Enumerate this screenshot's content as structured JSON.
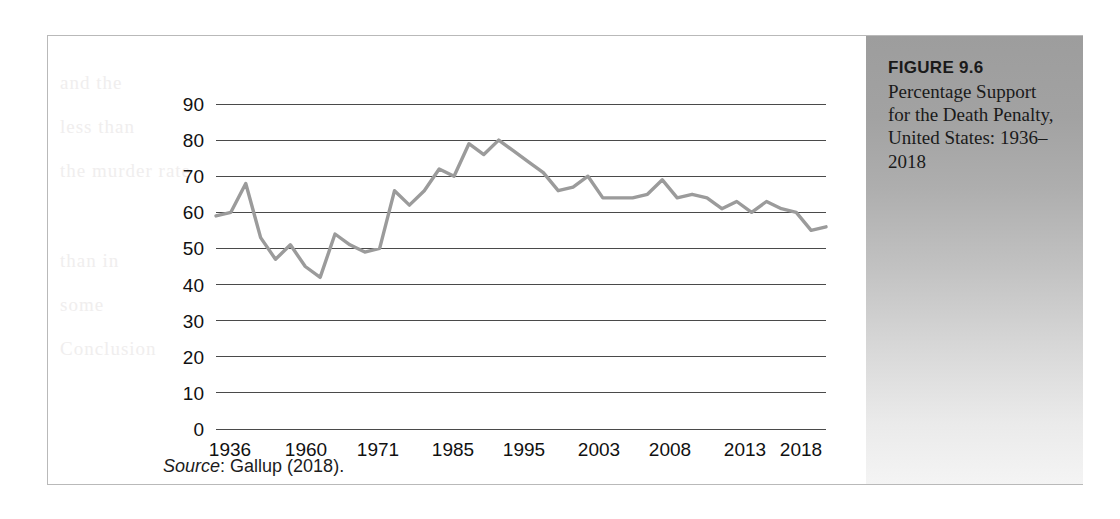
{
  "figure": {
    "title": "FIGURE 9.6",
    "caption": "Percentage Support for the Death Penalty, United States: 1936–2018"
  },
  "source": {
    "label": "Source",
    "separator": ": ",
    "text": "Gallup (2018)."
  },
  "bleed_text": [
    "and the",
    "less than",
    "the murder rate",
    "than in",
    "some",
    "Conclusion"
  ],
  "chart_data": {
    "type": "line",
    "title": "Percentage Support for the Death Penalty, United States: 1936–2018",
    "xlabel": "",
    "ylabel": "",
    "ylim": [
      0,
      90
    ],
    "yticks": [
      0,
      10,
      20,
      30,
      40,
      50,
      60,
      70,
      80,
      90
    ],
    "xtick_labels": [
      "1936",
      "1960",
      "1971",
      "1985",
      "1995",
      "2003",
      "2008",
      "2013",
      "2018"
    ],
    "xtick_values": [
      1936,
      1960,
      1971,
      1985,
      1995,
      2003,
      2008,
      2013,
      2018
    ],
    "grid": true,
    "legend": "none",
    "line_color": "#9b9b9b",
    "series": [
      {
        "name": "Percentage support for the death penalty",
        "x": [
          1936,
          1937,
          1953,
          1956,
          1957,
          1960,
          1965,
          1966,
          1967,
          1969,
          1971,
          1972,
          1976,
          1978,
          1981,
          1985,
          1986,
          1988,
          1991,
          1994,
          1995,
          1997,
          1999,
          2000,
          2001,
          2002,
          2003,
          2004,
          2005,
          2006,
          2007,
          2008,
          2009,
          2010,
          2011,
          2012,
          2013,
          2014,
          2015,
          2016,
          2017,
          2018
        ],
        "values": [
          59,
          60,
          68,
          53,
          47,
          51,
          45,
          42,
          54,
          51,
          49,
          50,
          66,
          62,
          66,
          72,
          70,
          79,
          76,
          80,
          77,
          74,
          71,
          66,
          67,
          70,
          64,
          64,
          64,
          65,
          69,
          64,
          65,
          64,
          61,
          63,
          60,
          63,
          61,
          60,
          55,
          56
        ]
      }
    ],
    "annotations": []
  },
  "plot_geometry": {
    "x_left_px": 168,
    "x_right_px": 778,
    "y_zero_px": 393,
    "y_ninety_px": 68,
    "x_tick_px": [
      182,
      258,
      330,
      405,
      476,
      551,
      622,
      697,
      753
    ]
  }
}
